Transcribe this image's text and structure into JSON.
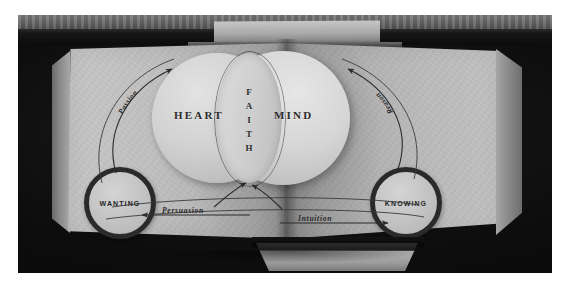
{
  "image": {
    "title": "Open book with Heart / Mind Venn diagram",
    "medium": "black-and-white photograph",
    "border_color": "#ffffff",
    "backdrop_color": "#0d0d0d",
    "paper_color": "#c2c2c2",
    "ink_color": "#2b2b2b"
  },
  "diagram": {
    "left_circle_label": "HEART",
    "right_circle_label": "MIND",
    "intersection_label": "FAITH",
    "intersection_letters": [
      "F",
      "A",
      "I",
      "T",
      "H"
    ],
    "left_node_label": "WANTING",
    "right_node_label": "KNOWING",
    "left_arc_label": "Passion",
    "right_arc_label": "Reason",
    "bottom_left_label": "Persuasion",
    "bottom_right_label": "Intuition",
    "arrows": [
      {
        "name": "passion-arc",
        "from": "WANTING",
        "to": "HEART",
        "direction": "up-right",
        "label": "Passion"
      },
      {
        "name": "reason-arc",
        "from": "KNOWING",
        "to": "MIND",
        "direction": "up-left",
        "label": "Reason"
      },
      {
        "name": "persuasion-arrow",
        "from": "center",
        "to": "WANTING",
        "direction": "left",
        "label": "Persuasion"
      },
      {
        "name": "intuition-arrow",
        "from": "center",
        "to": "KNOWING",
        "direction": "right",
        "label": "Intuition"
      },
      {
        "name": "converge-left-arrow",
        "from": "lower-left",
        "to": "FAITH",
        "direction": "up-right",
        "label": ""
      },
      {
        "name": "converge-right-arrow",
        "from": "lower-right",
        "to": "FAITH",
        "direction": "up-left",
        "label": ""
      }
    ]
  }
}
